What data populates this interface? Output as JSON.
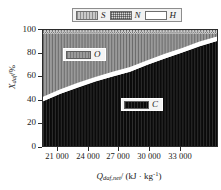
{
  "legend": {
    "entries": [
      {
        "label": "S",
        "swatch": "hatched-gray-swatch"
      },
      {
        "label": "N",
        "swatch": "checkered-swatch"
      },
      {
        "label": "H",
        "swatch": "white-swatch"
      }
    ]
  },
  "annotations": [
    {
      "id": "O",
      "label": "O",
      "swatch": "gray-swatch"
    },
    {
      "id": "C",
      "label": "C",
      "swatch": "black-swatch"
    }
  ],
  "axes": {
    "y": {
      "label_main": "X",
      "label_sub": "daf",
      "label_unit": "/%",
      "ticks": [
        "0",
        "20",
        "40",
        "60",
        "80",
        "100"
      ]
    },
    "x": {
      "label_main": "Q",
      "label_sub": "daf,net",
      "label_unit": "/ (kJ · kg",
      "label_sup": "-1",
      "label_close": ")",
      "ticks": [
        "21 000",
        "24 000",
        "27 000",
        "30 000",
        "33 000"
      ]
    }
  },
  "colors": {
    "C": "#0a0a0a",
    "O": "#9a9a9a",
    "H": "#ffffff",
    "N": "#d8d8d8",
    "S": "#c9c9c9",
    "axis": "#2b2b2b",
    "legend_bg": "#f2f2f2"
  },
  "chart_data": {
    "type": "area",
    "title": "",
    "xlabel": "Q_daf,net / (kJ · kg^-1)",
    "ylabel": "X_daf / %",
    "xlim": [
      19500,
      34500
    ],
    "ylim": [
      0,
      100
    ],
    "xticks": [
      21000,
      24000,
      27000,
      30000,
      33000
    ],
    "yticks": [
      0,
      20,
      40,
      60,
      80,
      100
    ],
    "grid": false,
    "legend_position": "above-plot",
    "stacked": true,
    "x": [
      19500,
      21000,
      22500,
      24000,
      25500,
      27000,
      28500,
      30000,
      31500,
      33000,
      34500
    ],
    "series": [
      {
        "name": "C",
        "values": [
          38.5,
          45.0,
          50.5,
          55.5,
          60.0,
          64.0,
          70.0,
          75.5,
          80.5,
          86.0,
          90.5
        ]
      },
      {
        "name": "H",
        "values": [
          4.0,
          4.0,
          4.0,
          4.0,
          4.0,
          4.0,
          4.0,
          4.0,
          4.0,
          4.0,
          4.0
        ]
      },
      {
        "name": "O",
        "values": [
          54.5,
          48.0,
          42.5,
          37.5,
          33.0,
          29.0,
          23.0,
          17.5,
          12.5,
          7.0,
          2.5
        ]
      },
      {
        "name": "N",
        "values": [
          1.5,
          1.5,
          1.5,
          1.5,
          1.5,
          1.5,
          1.5,
          1.5,
          1.5,
          1.5,
          1.5
        ]
      },
      {
        "name": "S",
        "values": [
          1.5,
          1.5,
          1.5,
          1.5,
          1.5,
          1.5,
          1.5,
          1.5,
          1.5,
          1.5,
          1.5
        ]
      }
    ],
    "cumulative_boundaries": {
      "C_top": [
        38.5,
        45.0,
        50.5,
        55.5,
        60.0,
        64.0,
        70.0,
        75.5,
        80.5,
        86.0,
        90.5
      ],
      "H_top": [
        42.5,
        49.0,
        54.5,
        59.5,
        64.0,
        68.0,
        74.0,
        79.5,
        84.5,
        90.0,
        94.5
      ],
      "O_top": [
        97.0,
        97.0,
        97.0,
        97.0,
        97.0,
        97.0,
        97.0,
        97.0,
        97.0,
        97.0,
        97.0
      ],
      "N_top": [
        98.5,
        98.5,
        98.5,
        98.5,
        98.5,
        98.5,
        98.5,
        98.5,
        98.5,
        98.5,
        98.5
      ],
      "S_top": [
        100,
        100,
        100,
        100,
        100,
        100,
        100,
        100,
        100,
        100,
        100
      ]
    }
  }
}
